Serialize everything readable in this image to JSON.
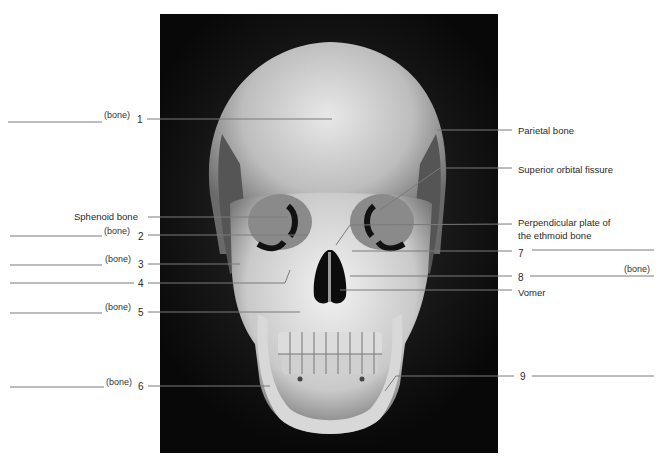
{
  "figure": {
    "blank_suffix": "(bone)",
    "left_labels": [
      {
        "id": "1",
        "number": "1",
        "has_blank": true,
        "suffix": "(bone)"
      },
      {
        "id": "sphenoid",
        "text": "Sphenoid bone"
      },
      {
        "id": "2",
        "number": "2",
        "has_blank": true,
        "suffix": "(bone)"
      },
      {
        "id": "3",
        "number": "3",
        "has_blank": true,
        "suffix": "(bone)"
      },
      {
        "id": "4",
        "number": "4",
        "has_blank": true
      },
      {
        "id": "5",
        "number": "5",
        "has_blank": true,
        "suffix": "(bone)"
      },
      {
        "id": "6",
        "number": "6",
        "has_blank": true,
        "suffix": "(bone)"
      }
    ],
    "right_labels": [
      {
        "id": "parietal",
        "text": "Parietal bone"
      },
      {
        "id": "sof",
        "text": "Superior orbital fissure"
      },
      {
        "id": "perp",
        "text_line1": "Perpendicular plate of",
        "text_line2": "the ethmoid bone"
      },
      {
        "id": "7",
        "number": "7",
        "has_blank": true
      },
      {
        "id": "8",
        "number": "8",
        "has_blank": true,
        "suffix": "(bone)"
      },
      {
        "id": "vomer",
        "text": "Vomer"
      },
      {
        "id": "9",
        "number": "9",
        "has_blank": true
      }
    ]
  }
}
